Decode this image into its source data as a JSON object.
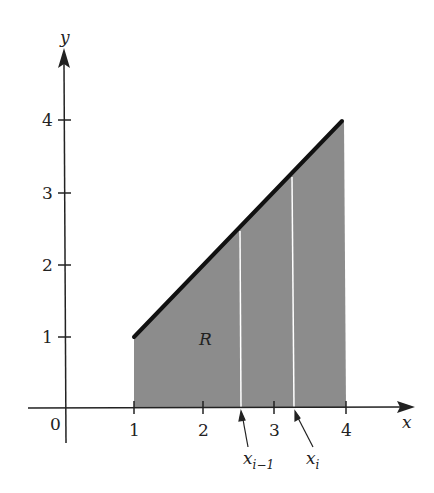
{
  "figure": {
    "region_label": "R",
    "axes": {
      "x_label": "x",
      "y_label": "y",
      "origin_label": "0",
      "x_ticks": [
        "1",
        "2",
        "3",
        "4"
      ],
      "y_ticks": [
        "1",
        "2",
        "3",
        "4"
      ]
    },
    "partition_labels": {
      "left": {
        "base": "x",
        "subscript": "i−1"
      },
      "right": {
        "base": "x",
        "subscript": "i"
      }
    },
    "colors": {
      "fill": "#8c8c8c",
      "line": "#111111",
      "partition": "#ffffff"
    },
    "function": "y = x",
    "interval": [
      1,
      4
    ],
    "partition_x": [
      2.48,
      3.22
    ]
  }
}
